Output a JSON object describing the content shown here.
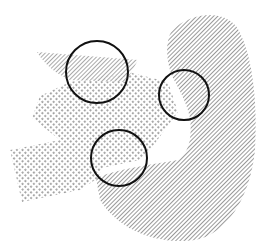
{
  "diagram": {
    "width": 265,
    "height": 249,
    "background": "#ffffff",
    "regions": [
      {
        "id": "hatched-crescent",
        "pattern": "diagonal-hatch",
        "color": "#777777",
        "path": "M 172 30 C 190 14, 220 8, 236 26 C 252 50, 258 100, 255 150 C 250 200, 225 235, 195 240 C 160 245, 120 232, 100 200 L 96 178 C 120 168, 150 165, 178 160 C 190 152, 192 135, 190 118 C 186 100, 178 88, 172 76 C 166 60, 165 42, 172 30 Z"
      },
      {
        "id": "hatched-band",
        "pattern": "diagonal-hatch",
        "color": "#777777",
        "path": "M 37 52 L 138 60 L 126 82 L 70 80 C 56 74, 44 64, 37 52 Z"
      },
      {
        "id": "dotted-arrow",
        "pattern": "dots",
        "color": "#666666",
        "path": "M 70 82 L 128 72 L 168 82 L 178 112 L 150 150 L 140 160 L 102 168 L 98 178 L 80 190 L 22 202 L 10 150 L 60 140 L 32 118 L 40 96 Z"
      }
    ],
    "circles": [
      {
        "id": "circle-top-left",
        "cx": 97,
        "cy": 72,
        "r": 31,
        "stroke": "#111111",
        "stroke_width": 2
      },
      {
        "id": "circle-right",
        "cx": 184,
        "cy": 95,
        "r": 25,
        "stroke": "#111111",
        "stroke_width": 2
      },
      {
        "id": "circle-bottom",
        "cx": 119,
        "cy": 158,
        "r": 28,
        "stroke": "#111111",
        "stroke_width": 2
      }
    ]
  }
}
